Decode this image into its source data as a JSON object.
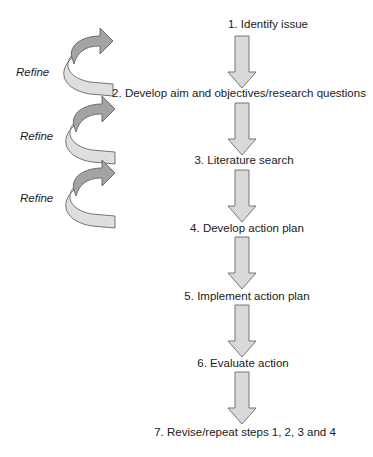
{
  "diagram": {
    "type": "flowchart",
    "steps": [
      {
        "label": "1.   Identify issue",
        "y": 24
      },
      {
        "label": "2. Develop aim and objectives/research questions",
        "y": 93
      },
      {
        "label": "3. Literature search",
        "y": 160
      },
      {
        "label": "4. Develop action plan",
        "y": 228
      },
      {
        "label": "5. Implement action plan",
        "y": 296
      },
      {
        "label": "6. Evaluate action",
        "y": 363
      },
      {
        "label": "7. Revise/repeat steps 1, 2, 3 and 4",
        "y": 432
      }
    ],
    "refine_loops": [
      {
        "label": "Refine"
      },
      {
        "label": "Refine"
      },
      {
        "label": "Refine"
      }
    ],
    "colors": {
      "down_arrow_fill": "#d9d9d9",
      "down_arrow_stroke": "#6a6a6a",
      "spiral_top_fill": "#a3a3a3",
      "spiral_bottom_fill": "#dedede",
      "text": "#1a1a1a"
    }
  }
}
